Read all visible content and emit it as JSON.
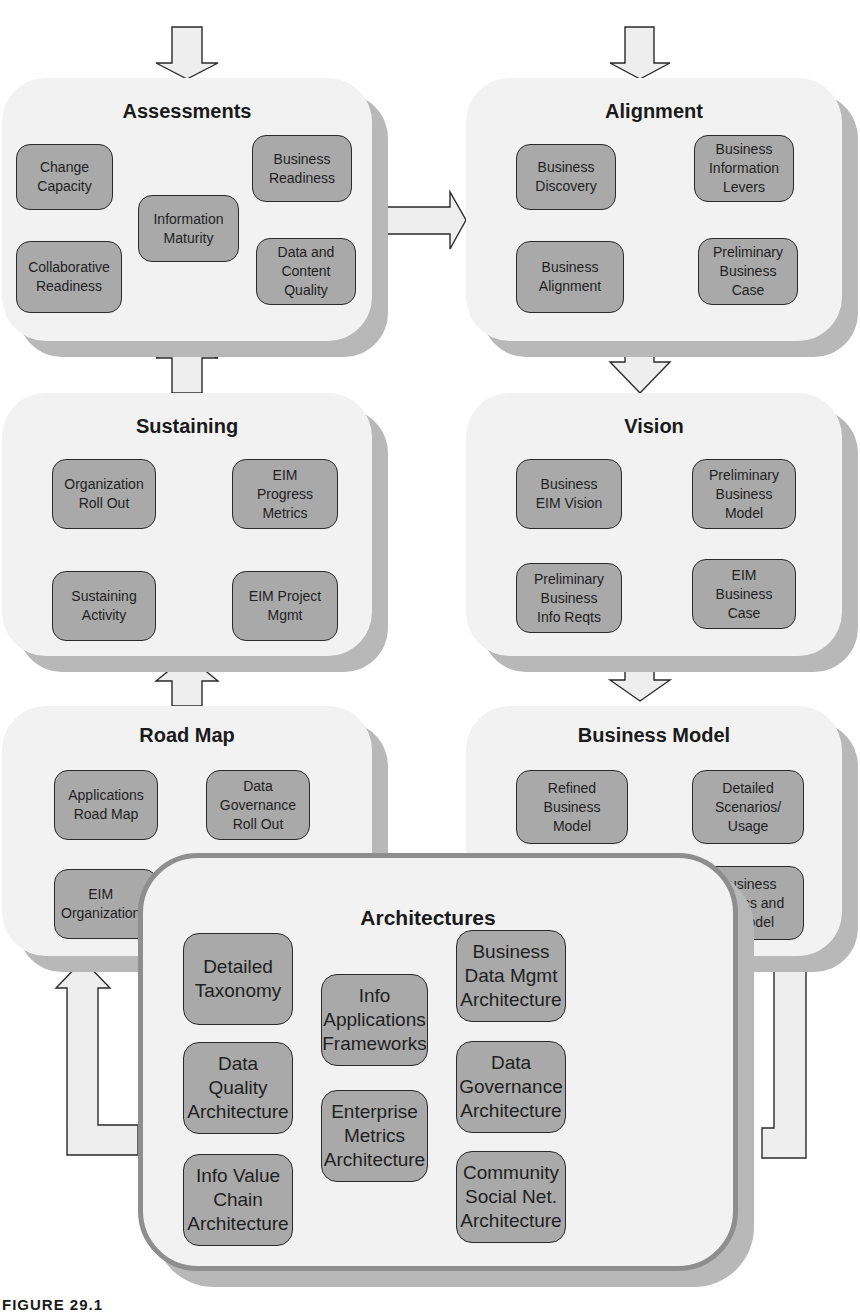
{
  "panels": {
    "assessments": {
      "title": "Assessments",
      "items": [
        "Change\nCapacity",
        "Business\nReadiness",
        "Information\nMaturity",
        "Collaborative\nReadiness",
        "Data and\nContent\nQuality"
      ]
    },
    "alignment": {
      "title": "Alignment",
      "items": [
        "Business\nDiscovery",
        "Business\nInformation\nLevers",
        "Business\nAlignment",
        "Preliminary\nBusiness\nCase"
      ]
    },
    "sustaining": {
      "title": "Sustaining",
      "items": [
        "Organization\nRoll Out",
        "EIM\nProgress\nMetrics",
        "Sustaining\nActivity",
        "EIM Project\nMgmt"
      ]
    },
    "vision": {
      "title": "Vision",
      "items": [
        "Business\nEIM Vision",
        "Preliminary\nBusiness\nModel",
        "Preliminary\nBusiness\nInfo Reqts",
        "EIM\nBusiness\nCase"
      ]
    },
    "road_map": {
      "title": "Road Map",
      "items": [
        "Applications\nRoad Map",
        "Data\nGovernance\nRoll Out",
        "EIM\nOrganization"
      ]
    },
    "business_model": {
      "title": "Business Model",
      "items": [
        "Refined\nBusiness\nModel",
        "Detailed\nScenarios/\nUsage",
        "Business\nMetrics and\nR Model"
      ]
    },
    "architectures": {
      "title": "Architectures",
      "items": [
        "Detailed\nTaxonomy",
        "Info\nApplications\nFrameworks",
        "Business\nData Mgmt\nArchitecture",
        "Data Quality\nArchitecture",
        "Enterprise\nMetrics\nArchitecture",
        "Data\nGovernance\nArchitecture",
        "Info Value\nChain\nArchitecture",
        "Community\nSocial Net.\nArchitecture"
      ]
    }
  },
  "caption": "FIGURE 29.1",
  "colors": {
    "panel_fill": "#f2f2f2",
    "panel_shadow": "#b8b8b8",
    "box_fill": "#a9a9a9",
    "box_border": "#2a2a2a",
    "arrow_fill": "#eeeeee"
  }
}
